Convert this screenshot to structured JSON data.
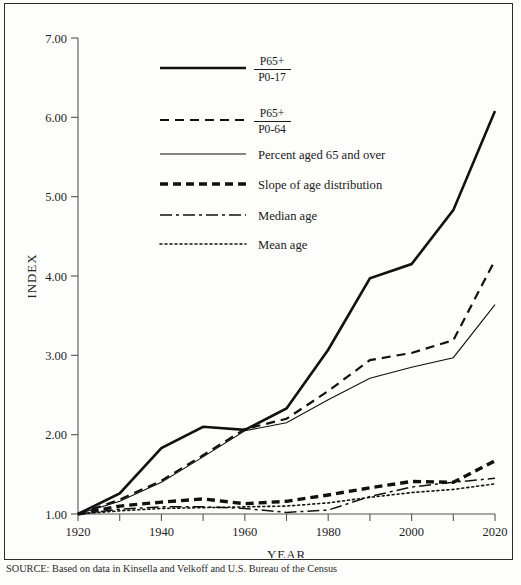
{
  "figure": {
    "source_note": "SOURCE: Based on data in Kinsella and Velkoff and U.S. Bureau of the Census"
  },
  "chart_data": {
    "type": "line",
    "title": "",
    "xlabel": "YEAR",
    "ylabel": "INDEX",
    "xlim": [
      1920,
      2020
    ],
    "ylim": [
      1.0,
      7.0
    ],
    "grid": false,
    "legend_position": "upper-left-inside",
    "x": [
      1920,
      1930,
      1940,
      1950,
      1960,
      1970,
      1980,
      1990,
      2000,
      2010,
      2020
    ],
    "xticks_major": [
      1920,
      1940,
      1960,
      1980,
      2000,
      2020
    ],
    "xticks_minor": [
      1930,
      1950,
      1970,
      1990,
      2010
    ],
    "xtick_labels": [
      "1920",
      "1940",
      "1960",
      "1980",
      "2000",
      "2020"
    ],
    "yticks": [
      1.0,
      2.0,
      3.0,
      4.0,
      5.0,
      6.0,
      7.0
    ],
    "ytick_labels": [
      "1.00",
      "2.00",
      "3.00",
      "4.00",
      "5.00",
      "6.00",
      "7.00"
    ],
    "series": [
      {
        "name": "P65+ / P0-17",
        "legend_numerator": "P65+",
        "legend_denominator": "P0-17",
        "style": "solid-thick",
        "color": "#111111",
        "width": 2.6,
        "dash": "none",
        "values": [
          1.0,
          1.26,
          1.83,
          2.1,
          2.06,
          2.33,
          3.07,
          3.97,
          4.15,
          4.83,
          6.08
        ]
      },
      {
        "name": "P65+ / P0-64",
        "legend_numerator": "P65+",
        "legend_denominator": "P0-64",
        "style": "dashed-medium",
        "color": "#111111",
        "width": 2.2,
        "dash": "9,6",
        "values": [
          1.0,
          1.18,
          1.42,
          1.74,
          2.07,
          2.2,
          2.55,
          2.94,
          3.03,
          3.19,
          4.2
        ]
      },
      {
        "name": "Percent aged 65 and over",
        "legend_numerator": "",
        "legend_denominator": "",
        "style": "solid-thin",
        "color": "#111111",
        "width": 1.1,
        "dash": "none",
        "values": [
          1.0,
          1.16,
          1.4,
          1.72,
          2.05,
          2.15,
          2.44,
          2.71,
          2.85,
          2.97,
          3.64
        ]
      },
      {
        "name": "Slope of age distribution",
        "legend_numerator": "",
        "legend_denominator": "",
        "style": "dashed-heavy",
        "color": "#111111",
        "width": 3.4,
        "dash": "8,5",
        "values": [
          1.0,
          1.1,
          1.15,
          1.19,
          1.13,
          1.16,
          1.24,
          1.33,
          1.41,
          1.4,
          1.67
        ]
      },
      {
        "name": "Median age",
        "legend_numerator": "",
        "legend_denominator": "",
        "style": "dash-dot",
        "color": "#111111",
        "width": 1.5,
        "dash": "12,4,3,4",
        "values": [
          1.0,
          1.06,
          1.09,
          1.09,
          1.07,
          1.02,
          1.05,
          1.22,
          1.34,
          1.4,
          1.45
        ]
      },
      {
        "name": "Mean age",
        "legend_numerator": "",
        "legend_denominator": "",
        "style": "dotted",
        "color": "#111111",
        "width": 1.6,
        "dash": "2,3",
        "values": [
          1.0,
          1.04,
          1.07,
          1.08,
          1.09,
          1.1,
          1.14,
          1.21,
          1.27,
          1.31,
          1.38
        ]
      }
    ]
  }
}
